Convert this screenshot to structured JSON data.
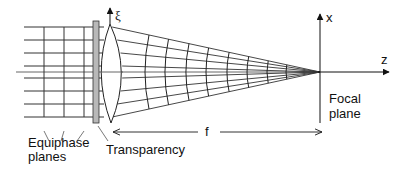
{
  "figure": {
    "labels": {
      "equiphase_line1": "Equiphase",
      "equiphase_line2": "planes",
      "transparency": "Transparency",
      "focal_line1": "Focal",
      "focal_line2": "plane",
      "focal_length": "f",
      "xi_axis": "ξ",
      "x_axis": "x",
      "z_axis": "z"
    },
    "colors": {
      "line": "#222222",
      "transparency_fill": "#b8b8b8",
      "background": "#ffffff"
    },
    "geometry": {
      "ray_y": [
        27,
        40,
        53,
        66,
        78,
        91,
        104,
        117
      ],
      "axis_y": 72,
      "equiphase_x": [
        44,
        64,
        84
      ],
      "transparency": {
        "x": 93,
        "y": 21,
        "w": 6,
        "h": 102
      },
      "lens": {
        "top_x": 110,
        "top_y": 24,
        "bottom_x": 111,
        "bottom_y": 123,
        "left_x": 101,
        "right_x": 123
      },
      "focus": {
        "x": 320,
        "y": 72
      },
      "wavefront_x": [
        145,
        165,
        186,
        206,
        227,
        247,
        267,
        286
      ]
    }
  }
}
